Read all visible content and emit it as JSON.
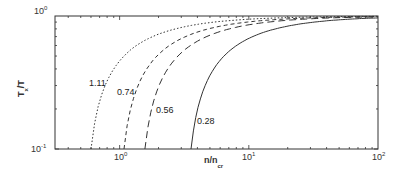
{
  "chart_data": {
    "type": "line",
    "title": "",
    "xlabel": "n/n_cr",
    "ylabel": "T_x/T",
    "xscale": "log",
    "yscale": "log",
    "xlim": [
      0.316,
      100
    ],
    "ylim": [
      0.1,
      1
    ],
    "grid": false,
    "legend": "none (inline curve labels)",
    "x_ticks": [
      {
        "value": 1,
        "label": "10",
        "exp": "0"
      },
      {
        "value": 10,
        "label": "10",
        "exp": "1"
      },
      {
        "value": 100,
        "label": "10",
        "exp": "2"
      }
    ],
    "y_ticks": [
      {
        "value": 0.1,
        "label": "10",
        "exp": "-1"
      },
      {
        "value": 1,
        "label": "10",
        "exp": "0"
      }
    ],
    "series": [
      {
        "name": "1.11",
        "style": "dotted",
        "x": [
          0.6,
          0.7,
          0.85,
          1,
          1.5,
          2,
          3,
          5,
          10,
          20,
          50,
          100
        ],
        "y": [
          0.1,
          0.23,
          0.36,
          0.46,
          0.64,
          0.73,
          0.82,
          0.89,
          0.946,
          0.973,
          0.989,
          0.995
        ]
      },
      {
        "name": "0.74",
        "style": "short-dash",
        "x": [
          1.08,
          1.3,
          1.6,
          2,
          3,
          5,
          10,
          20,
          50,
          100
        ],
        "y": [
          0.1,
          0.25,
          0.39,
          0.515,
          0.68,
          0.81,
          0.903,
          0.952,
          0.981,
          0.99
        ]
      },
      {
        "name": "0.56",
        "style": "long-dash",
        "x": [
          1.57,
          1.8,
          2.2,
          3,
          5,
          10,
          20,
          50,
          100
        ],
        "y": [
          0.1,
          0.22,
          0.36,
          0.53,
          0.72,
          0.859,
          0.93,
          0.972,
          0.986
        ]
      },
      {
        "name": "0.28",
        "style": "solid",
        "x": [
          3.57,
          4,
          5,
          6,
          8,
          10,
          15,
          20,
          30,
          50,
          100
        ],
        "y": [
          0.1,
          0.2,
          0.36,
          0.47,
          0.6,
          0.68,
          0.79,
          0.84,
          0.893,
          0.936,
          0.968
        ]
      }
    ],
    "annotations": [
      {
        "text": "1.11",
        "near_series": "1.11"
      },
      {
        "text": "0.74",
        "near_series": "0.74"
      },
      {
        "text": "0.56",
        "near_series": "0.56"
      },
      {
        "text": "0.28",
        "near_series": "0.28"
      }
    ]
  },
  "labels": {
    "x_main": "n/n",
    "x_sub": "cr",
    "y_main_a": "T",
    "y_sub": "x",
    "y_main_b": "/T",
    "tick_base": "10",
    "xt0_exp": "0",
    "xt1_exp": "1",
    "xt2_exp": "2",
    "yt0_exp": "0",
    "yt1_exp": "-1",
    "curve_111": "1.11",
    "curve_074": "0.74",
    "curve_056": "0.56",
    "curve_028": "0.28"
  }
}
